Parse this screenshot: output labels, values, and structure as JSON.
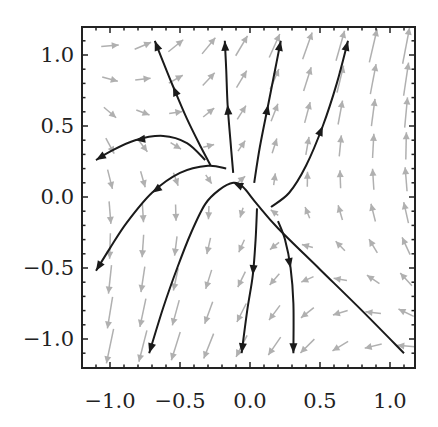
{
  "chart_data": {
    "type": "vector-field",
    "title": "",
    "xlabel": "",
    "ylabel": "",
    "xlim": [
      -1.2,
      1.2
    ],
    "ylim": [
      -1.2,
      1.2
    ],
    "grid": false,
    "legend": null,
    "x_ticks": [
      -1.0,
      -0.5,
      0.0,
      0.5,
      1.0
    ],
    "x_tick_labels": [
      "−1.0",
      "−0.5",
      "0.0",
      "0.5",
      "1.0"
    ],
    "y_ticks": [
      -1.0,
      -0.5,
      0.0,
      0.5,
      1.0
    ],
    "y_tick_labels": [
      "−1.0",
      "−0.5",
      "0.0",
      "0.5",
      "1.0"
    ],
    "vector_field": {
      "description": "Gray direction-field arrows on a 10x10 grid; saddle-like flow, up-right in upper right, down-left in lower left",
      "grid_x": [
        -1.0,
        -0.75,
        -0.5,
        -0.25,
        0.0,
        0.25,
        0.5,
        0.75,
        1.0,
        1.1
      ],
      "approx_field": {
        "u": "0.55*y - 0.15*x",
        "v": "x + y"
      },
      "color": "#b0b0b0"
    },
    "trajectories": [
      {
        "name": "upper-left-curve-up",
        "direction": "forward",
        "points": [
          [
            -0.28,
            0.22
          ],
          [
            -0.35,
            0.35
          ],
          [
            -0.45,
            0.55
          ],
          [
            -0.55,
            0.78
          ],
          [
            -0.62,
            0.95
          ],
          [
            -0.68,
            1.1
          ]
        ]
      },
      {
        "name": "left-arc",
        "direction": "forward",
        "points": [
          [
            -0.32,
            0.26
          ],
          [
            -0.45,
            0.38
          ],
          [
            -0.62,
            0.43
          ],
          [
            -0.82,
            0.4
          ],
          [
            -1.0,
            0.32
          ],
          [
            -1.1,
            0.26
          ]
        ]
      },
      {
        "name": "left-arc-lower",
        "direction": "forward",
        "points": [
          [
            -0.17,
            0.2
          ],
          [
            -0.3,
            0.22
          ],
          [
            -0.5,
            0.17
          ],
          [
            -0.7,
            0.03
          ],
          [
            -0.88,
            -0.18
          ],
          [
            -1.0,
            -0.36
          ],
          [
            -1.1,
            -0.52
          ]
        ]
      },
      {
        "name": "center-up",
        "direction": "forward",
        "points": [
          [
            -0.12,
            0.17
          ],
          [
            -0.14,
            0.4
          ],
          [
            -0.16,
            0.65
          ],
          [
            -0.17,
            0.9
          ],
          [
            -0.18,
            1.1
          ]
        ]
      },
      {
        "name": "center-up-right",
        "direction": "forward",
        "points": [
          [
            0.03,
            0.1
          ],
          [
            0.07,
            0.35
          ],
          [
            0.13,
            0.65
          ],
          [
            0.18,
            0.9
          ],
          [
            0.22,
            1.1
          ]
        ]
      },
      {
        "name": "right-curve-up",
        "direction": "forward",
        "points": [
          [
            0.15,
            -0.07
          ],
          [
            0.28,
            0.03
          ],
          [
            0.4,
            0.22
          ],
          [
            0.52,
            0.5
          ],
          [
            0.62,
            0.8
          ],
          [
            0.7,
            1.1
          ]
        ]
      },
      {
        "name": "separatrix-hump",
        "direction": "forward",
        "points": [
          [
            1.1,
            -1.1
          ],
          [
            0.8,
            -0.8
          ],
          [
            0.5,
            -0.51
          ],
          [
            0.2,
            -0.22
          ],
          [
            0.05,
            -0.05
          ],
          [
            -0.05,
            0.07
          ],
          [
            -0.12,
            0.1
          ],
          [
            -0.22,
            0.05
          ],
          [
            -0.32,
            -0.05
          ],
          [
            -0.42,
            -0.25
          ],
          [
            -0.52,
            -0.5
          ],
          [
            -0.62,
            -0.78
          ],
          [
            -0.72,
            -1.1
          ]
        ]
      },
      {
        "name": "center-down",
        "direction": "forward",
        "points": [
          [
            0.05,
            -0.08
          ],
          [
            0.04,
            -0.3
          ],
          [
            0.02,
            -0.55
          ],
          [
            -0.02,
            -0.8
          ],
          [
            -0.06,
            -1.1
          ]
        ]
      },
      {
        "name": "right-down",
        "direction": "forward",
        "points": [
          [
            0.2,
            -0.17
          ],
          [
            0.25,
            -0.3
          ],
          [
            0.29,
            -0.5
          ],
          [
            0.31,
            -0.75
          ],
          [
            0.31,
            -1.1
          ]
        ]
      }
    ],
    "trajectory_color": "#1a1a1a"
  }
}
